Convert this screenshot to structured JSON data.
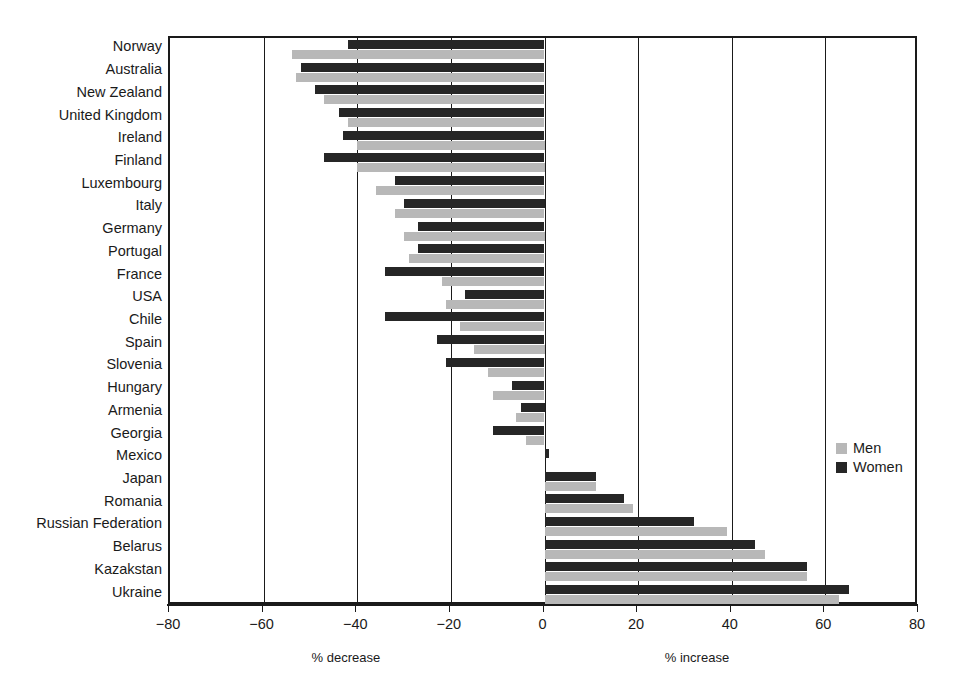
{
  "chart_data": {
    "type": "bar",
    "orientation": "horizontal",
    "title": "",
    "xlabel": "",
    "ylabel": "",
    "xlim": [
      -80,
      80
    ],
    "xticks": [
      -80,
      -60,
      -40,
      -20,
      0,
      20,
      40,
      60,
      80
    ],
    "xtick_labels": [
      "−80",
      "−60",
      "−40",
      "−20",
      "0",
      "20",
      "40",
      "60",
      "80"
    ],
    "grid": true,
    "grid_axis": "x",
    "legend_position": "center-right",
    "axis_captions": {
      "left": "% decrease",
      "right": "% increase"
    },
    "categories": [
      "Norway",
      "Australia",
      "New Zealand",
      "United Kingdom",
      "Ireland",
      "Finland",
      "Luxembourg",
      "Italy",
      "Germany",
      "Portugal",
      "France",
      "USA",
      "Chile",
      "Spain",
      "Slovenia",
      "Hungary",
      "Armenia",
      "Georgia",
      "Mexico",
      "Japan",
      "Romania",
      "Russian Federation",
      "Belarus",
      "Kazakstan",
      "Ukraine"
    ],
    "series": [
      {
        "name": "Women",
        "color": "#262626",
        "values": [
          -42,
          -52,
          -49,
          -44,
          -43,
          -47,
          -32,
          -30,
          -27,
          -27,
          -34,
          -17,
          -34,
          -23,
          -21,
          -7,
          -5,
          -11,
          1,
          11,
          17,
          32,
          45,
          56,
          65
        ]
      },
      {
        "name": "Men",
        "color": "#b8b8b8",
        "values": [
          -54,
          -53,
          -47,
          -42,
          -40,
          -40,
          -36,
          -32,
          -30,
          -29,
          -22,
          -21,
          -18,
          -15,
          -12,
          -11,
          -6,
          -4,
          0,
          11,
          19,
          39,
          47,
          56,
          63
        ]
      }
    ]
  },
  "legend": {
    "items": [
      {
        "label": "Men"
      },
      {
        "label": "Women"
      }
    ]
  },
  "colors": {
    "women": "#262626",
    "men": "#b8b8b8",
    "axis": "#1a1a1a",
    "background": "#ffffff"
  }
}
